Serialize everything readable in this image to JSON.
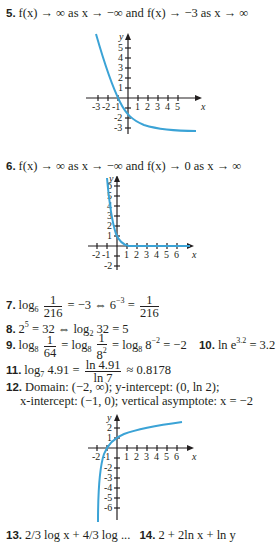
{
  "items": {
    "i5": {
      "num": "5.",
      "text": "f(x) → ∞ as x → −∞ and f(x) → −3 as x → ∞"
    },
    "i6": {
      "num": "6.",
      "text": "f(x) → ∞ as x → −∞ and f(x) → 0 as x → ∞"
    },
    "i7": {
      "num": "7.",
      "pre": "log",
      "base": "6",
      "frac1_num": "1",
      "frac1_den": "216",
      "mid": "= −3 ⇔ 6",
      "exp": "−3",
      "eq": "=",
      "frac2_num": "1",
      "frac2_den": "216"
    },
    "i8": {
      "num": "8.",
      "a": "2",
      "exp": "5",
      "b": "= 32 ⇔ log",
      "base": "2",
      "c": "32 = 5"
    },
    "i9": {
      "num": "9.",
      "pre": "log",
      "base": "8",
      "frac1_num": "1",
      "frac1_den": "64",
      "eq1": "= log",
      "base2": "8",
      "frac2_num": "1",
      "frac2_den": "8",
      "frac2_exp": "2",
      "eq2": "= log",
      "base3": "8",
      "rest": "8",
      "exp": "−2",
      "tail": "= −2"
    },
    "i10": {
      "num": "10.",
      "pre": "ln e",
      "exp": "3.2",
      "tail": "= 3.2"
    },
    "i11": {
      "num": "11.",
      "pre": "log",
      "base": "7",
      "arg": "4.91 =",
      "frac_num": "ln 4.91",
      "frac_den": "ln 7",
      "tail": "≈ 0.8178"
    },
    "i12": {
      "num": "12.",
      "line1": "Domain: (−2, ∞); y-intercept: (0, ln 2);",
      "line2": "x-intercept: (−1, 0); vertical asymptote: x = −2"
    },
    "i13": {
      "num": "13.",
      "text": "2/3 log x + 4/3 log ..."
    },
    "i14": {
      "num": "14.",
      "text": "2 + 2ln x + ln y"
    }
  },
  "graphs": [
    {
      "id": "graph-5",
      "x_label": "x",
      "y_label": "y",
      "x_ticks": [
        "-3",
        "-2",
        "-1",
        "1",
        "2",
        "3",
        "4",
        "5"
      ],
      "y_ticks": [
        "5",
        "4",
        "3",
        "2",
        "1",
        "-1",
        "-2",
        "-3"
      ],
      "curve": "decreasing exponential, asymptote y = -3"
    },
    {
      "id": "graph-6",
      "x_label": "x",
      "y_label": "y",
      "x_ticks": [
        "-2",
        "-1",
        "1",
        "2",
        "3",
        "4",
        "5",
        "6"
      ],
      "y_ticks": [
        "6",
        "5",
        "4",
        "3",
        "2",
        "1",
        "-1",
        "-2"
      ],
      "curve": "decreasing exponential, asymptote y = 0"
    },
    {
      "id": "graph-12",
      "x_label": "x",
      "y_label": "y",
      "x_ticks": [
        "-2",
        "-1",
        "1",
        "2",
        "3",
        "4",
        "5",
        "6"
      ],
      "y_ticks": [
        "2",
        "1",
        "-1",
        "-2",
        "-3",
        "-4",
        "-5",
        "-6"
      ],
      "curve": "y = ln(x + 2), vertical asymptote x = -2"
    }
  ],
  "colors": {
    "curve": "#3ba3d6",
    "text": "#231f20"
  }
}
